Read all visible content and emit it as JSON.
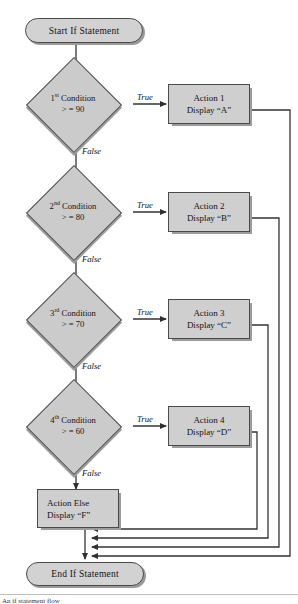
{
  "diagram": {
    "type": "flowchart",
    "title": "If statement flow",
    "start": {
      "label": "Start If Statement"
    },
    "end": {
      "label": "End  If Statement"
    },
    "branches": [
      {
        "ordinal": "1",
        "ordinal_suffix": "st",
        "condition_line1": "Condition",
        "condition_line2": ">  =  90",
        "true_label": "True",
        "false_label": "False",
        "action_line1": "Action 1",
        "action_line2": "Display “A”"
      },
      {
        "ordinal": "2",
        "ordinal_suffix": "nd",
        "condition_line1": "Condition",
        "condition_line2": ">  =  80",
        "true_label": "True",
        "false_label": "False",
        "action_line1": "Action 2",
        "action_line2": "Display “B”"
      },
      {
        "ordinal": "3",
        "ordinal_suffix": "rd",
        "condition_line1": "Condition",
        "condition_line2": ">  =  70",
        "true_label": "True",
        "false_label": "False",
        "action_line1": "Action 3",
        "action_line2": "Display “C”"
      },
      {
        "ordinal": "4",
        "ordinal_suffix": "th",
        "condition_line1": "Condition",
        "condition_line2": ">  =  60",
        "true_label": "True",
        "false_label": "False",
        "action_line1": "Action 4",
        "action_line2": "Display “D”"
      }
    ],
    "else_action": {
      "line1": "Action Else",
      "line2": "Display “F”"
    },
    "caption": "An if statement flow",
    "colors": {
      "shape_fill": "#cfcfcf",
      "shape_stroke": "#4a4a4a",
      "shadow": "#9c9c9c",
      "line": "#333333",
      "page_background": "#ffffff"
    }
  }
}
